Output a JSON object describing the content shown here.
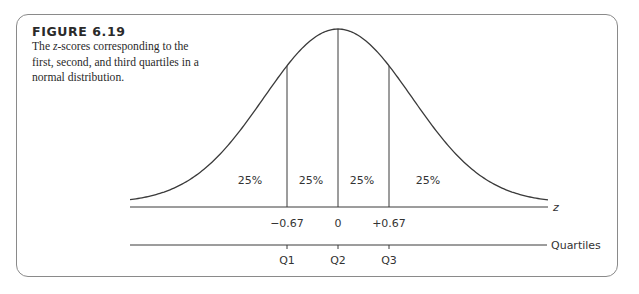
{
  "figure": {
    "label": "FIGURE 6.19",
    "caption_pre": "The ",
    "caption_var": "z",
    "caption_post": "-scores corresponding to the first, second, and third quartiles in a normal distribution."
  },
  "chart_data": {
    "type": "diagram",
    "curve": "standard normal density",
    "regions": [
      {
        "label": "25%",
        "from": "-inf",
        "to": -0.67
      },
      {
        "label": "25%",
        "from": -0.67,
        "to": 0
      },
      {
        "label": "25%",
        "from": 0,
        "to": 0.67
      },
      {
        "label": "25%",
        "from": 0.67,
        "to": "inf"
      }
    ],
    "z_axis": {
      "label": "z",
      "ticks": [
        {
          "value": -0.67,
          "label": "−0.67"
        },
        {
          "value": 0,
          "label": "0"
        },
        {
          "value": 0.67,
          "label": "+0.67"
        }
      ]
    },
    "quartile_axis": {
      "label": "Quartiles",
      "ticks": [
        "Q1",
        "Q2",
        "Q3"
      ]
    }
  },
  "labels": {
    "pct": [
      "25%",
      "25%",
      "25%",
      "25%"
    ],
    "z_ticks": [
      "−0.67",
      "0",
      "+0.67"
    ],
    "z_axis": "z",
    "q_ticks": [
      "Q1",
      "Q2",
      "Q3"
    ],
    "q_axis": "Quartiles"
  }
}
